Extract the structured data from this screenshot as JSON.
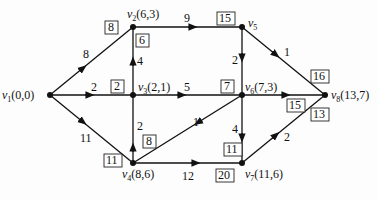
{
  "diagram": {
    "type": "directed-network-shortest-path",
    "nodes": [
      {
        "id": "v1",
        "label": "v",
        "sub": "1",
        "coords": "(0,0)"
      },
      {
        "id": "v2",
        "label": "v",
        "sub": "2",
        "coords": "(6,3)"
      },
      {
        "id": "v3",
        "label": "v",
        "sub": "3",
        "coords": "(2,1)"
      },
      {
        "id": "v4",
        "label": "v",
        "sub": "4",
        "coords": "(8,6)"
      },
      {
        "id": "v5",
        "label": "v",
        "sub": "5",
        "coords": ""
      },
      {
        "id": "v6",
        "label": "v",
        "sub": "6",
        "coords": "(7,3)"
      },
      {
        "id": "v7",
        "label": "v",
        "sub": "7",
        "coords": "(11,6)"
      },
      {
        "id": "v8",
        "label": "v",
        "sub": "8",
        "coords": "(13,7)"
      }
    ],
    "edges": [
      {
        "from": "v1",
        "to": "v2",
        "weight": "8"
      },
      {
        "from": "v1",
        "to": "v3",
        "weight": "2"
      },
      {
        "from": "v1",
        "to": "v4",
        "weight": "11"
      },
      {
        "from": "v3",
        "to": "v2",
        "weight": "4"
      },
      {
        "from": "v4",
        "to": "v3",
        "weight": "2"
      },
      {
        "from": "v2",
        "to": "v5",
        "weight": "9"
      },
      {
        "from": "v3",
        "to": "v6",
        "weight": "5"
      },
      {
        "from": "v6",
        "to": "v4",
        "weight": "1"
      },
      {
        "from": "v4",
        "to": "v7",
        "weight": "12"
      },
      {
        "from": "v5",
        "to": "v6",
        "weight": "2"
      },
      {
        "from": "v5",
        "to": "v8",
        "weight": "1"
      },
      {
        "from": "v6",
        "to": "v8",
        "weight": "8"
      },
      {
        "from": "v6",
        "to": "v7",
        "weight": "4"
      },
      {
        "from": "v7",
        "to": "v8",
        "weight": "2"
      }
    ],
    "boxed_labels": [
      {
        "value": "8",
        "near": "v1-v2"
      },
      {
        "value": "6",
        "near": "v3-v2"
      },
      {
        "value": "2",
        "near": "v1-v3"
      },
      {
        "value": "15",
        "near": "v2-v5"
      },
      {
        "value": "7",
        "near": "v3-v6"
      },
      {
        "value": "16",
        "near": "v5-v8"
      },
      {
        "value": "15",
        "near": "v6-v8"
      },
      {
        "value": "13",
        "near": "v7-v8"
      },
      {
        "value": "8",
        "near": "v6-v4"
      },
      {
        "value": "11",
        "near": "v1-v4"
      },
      {
        "value": "11",
        "near": "v6-v7"
      },
      {
        "value": "20",
        "near": "v4-v7"
      }
    ]
  }
}
